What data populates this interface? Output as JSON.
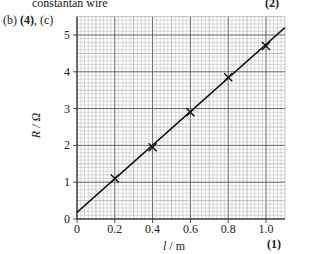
{
  "header": {
    "line1": "constantan wire",
    "marks1": "(2)",
    "part_label_prefix": "(b) ",
    "part_label_marks": "(4)",
    "part_label_suffix": ", (c)",
    "marks_bottom": "(1)"
  },
  "chart_data": {
    "type": "scatter",
    "title": "",
    "xlabel": "l / m",
    "ylabel": "R / Ω",
    "xlim": [
      0,
      1.1
    ],
    "ylim": [
      0,
      5.5
    ],
    "x_ticks": [
      "0",
      "0.2",
      "0.4",
      "0.6",
      "0.8",
      "1.0"
    ],
    "y_ticks": [
      "0",
      "1",
      "2",
      "3",
      "4",
      "5"
    ],
    "grid": true,
    "series": [
      {
        "name": "measured",
        "marker": "x",
        "x": [
          0.2,
          0.4,
          0.6,
          0.8,
          1.0
        ],
        "y": [
          1.1,
          1.95,
          2.9,
          3.85,
          4.7
        ]
      },
      {
        "name": "best-fit line",
        "type": "line",
        "x": [
          0,
          1.1
        ],
        "y": [
          0.18,
          5.2
        ]
      }
    ]
  },
  "colors": {
    "grid_major": "#555555",
    "grid_minor": "#9a9a9a",
    "line": "#111111",
    "text": "#222222"
  }
}
